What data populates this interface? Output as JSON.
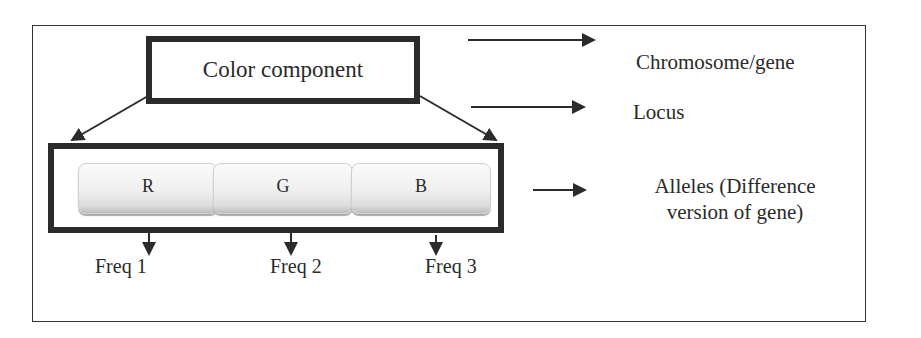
{
  "diagram": {
    "root": {
      "label": "Color component"
    },
    "alleles": [
      {
        "label": "R",
        "freq_label": "Freq 1"
      },
      {
        "label": "G",
        "freq_label": "Freq 2"
      },
      {
        "label": "B",
        "freq_label": "Freq 3"
      }
    ],
    "legend": [
      {
        "label": "Chromosome/gene"
      },
      {
        "label": "Locus"
      },
      {
        "label_line1": "Alleles (Difference",
        "label_line2": "version of gene)"
      }
    ],
    "colors": {
      "stroke": "#2b2b2b",
      "allele_fill_top": "#fafafa",
      "allele_fill_bottom": "#bdbdbd",
      "background": "#ffffff"
    }
  }
}
